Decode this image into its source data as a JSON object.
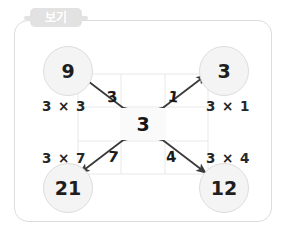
{
  "panel": {
    "tab_label": "보기"
  },
  "diagram": {
    "center": {
      "value": "3"
    },
    "nodes": [
      {
        "id": "top-left",
        "value": "9",
        "expression": "3 × 3",
        "multiplier": "3"
      },
      {
        "id": "top-right",
        "value": "3",
        "expression": "3 × 1",
        "multiplier": "1"
      },
      {
        "id": "bottom-left",
        "value": "21",
        "expression": "3 × 7",
        "multiplier": "7"
      },
      {
        "id": "bottom-right",
        "value": "12",
        "expression": "3 × 4",
        "multiplier": "4"
      }
    ]
  },
  "colors": {
    "panel_border": "#dcdcdc",
    "tab_background": "#e2e2e2",
    "tab_text": "#ffffff",
    "node_fill": "#f4f4f4",
    "node_border": "#dddddd",
    "grid_line": "#e8e8e8",
    "arrow": "#3a3a3a",
    "text": "#1e1e1e"
  }
}
